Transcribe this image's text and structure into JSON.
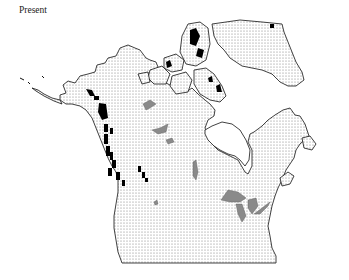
{
  "figure": {
    "panel_label": "Present",
    "region": "North America",
    "legend_styles": {
      "land_fill": "stippled",
      "lakes_fill": "#8a8a8a",
      "glacier_fill": "#000000",
      "outline": "#111111"
    }
  }
}
